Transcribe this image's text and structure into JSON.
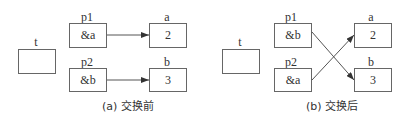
{
  "panels": [
    {
      "caption": "(a) 交换前",
      "t": {
        "label": "t",
        "value": ""
      },
      "p1": {
        "label": "p1",
        "value": "&a"
      },
      "p2": {
        "label": "p2",
        "value": "&b"
      },
      "a": {
        "label": "a",
        "value": "2"
      },
      "b": {
        "label": "b",
        "value": "3"
      },
      "edges": [
        {
          "from": "p1",
          "to": "a"
        },
        {
          "from": "p2",
          "to": "b"
        }
      ]
    },
    {
      "caption": "(b) 交换后",
      "t": {
        "label": "t",
        "value": ""
      },
      "p1": {
        "label": "p1",
        "value": "&b"
      },
      "p2": {
        "label": "p2",
        "value": "&a"
      },
      "a": {
        "label": "a",
        "value": "2"
      },
      "b": {
        "label": "b",
        "value": "3"
      },
      "edges": [
        {
          "from": "p1",
          "to": "b"
        },
        {
          "from": "p2",
          "to": "a"
        }
      ]
    }
  ],
  "colors": {
    "line": "#555555",
    "border": "#666666",
    "text": "#333333"
  }
}
